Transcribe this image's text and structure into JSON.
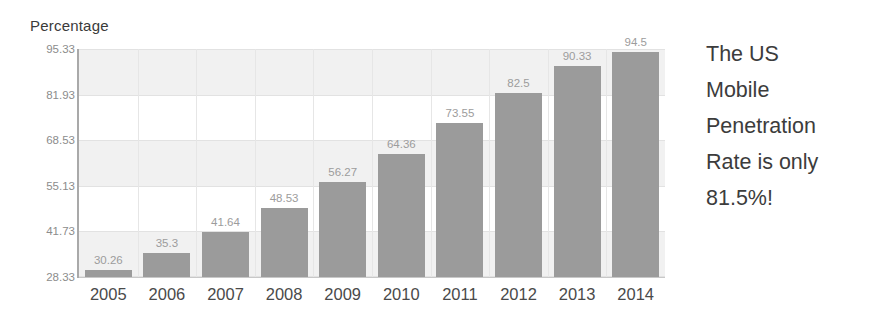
{
  "chart_data": {
    "type": "bar",
    "title": "",
    "ylabel": "Percentage",
    "xlabel": "",
    "categories": [
      "2005",
      "2006",
      "2007",
      "2008",
      "2009",
      "2010",
      "2011",
      "2012",
      "2013",
      "2014"
    ],
    "values": [
      30.26,
      35.3,
      41.64,
      48.53,
      56.27,
      64.36,
      73.55,
      82.5,
      90.33,
      94.5
    ],
    "value_labels": [
      "30.26",
      "35.3",
      "41.64",
      "48.53",
      "56.27",
      "64.36",
      "73.55",
      "82.5",
      "90.33",
      "94.5"
    ],
    "ylim": [
      28.33,
      95.33
    ],
    "ytick_labels": [
      "95.33",
      "81.93",
      "68.53",
      "55.13",
      "41.73",
      "28.33"
    ],
    "ytick_values": [
      95.33,
      81.93,
      68.53,
      55.13,
      41.73,
      28.33
    ],
    "grid": "horizontal-bands-and-vertical-lines",
    "legend": "none",
    "bar_color": "#9b9b9b",
    "band_color": "#f1f1f1",
    "plot_background": "#ffffff"
  },
  "callout": {
    "lines": [
      "The US",
      "Mobile",
      "Penetration",
      "Rate is only",
      "81.5%!"
    ]
  }
}
